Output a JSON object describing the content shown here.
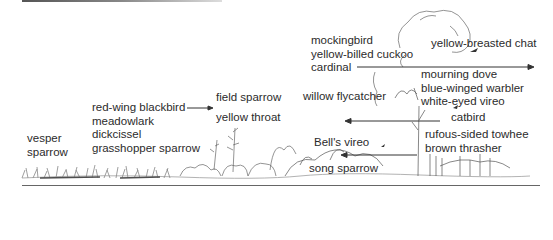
{
  "diagram": {
    "type": "habitat succession bird distribution",
    "groups": [
      {
        "id": "vesper",
        "lines": [
          "vesper",
          "sparrow"
        ]
      },
      {
        "id": "grassland",
        "lines": [
          "red-wing blackbird",
          "meadowlark",
          "dickcissel",
          "grasshopper sparrow"
        ]
      },
      {
        "id": "field-sparrow",
        "lines": [
          "field sparrow"
        ]
      },
      {
        "id": "yellow-throat",
        "lines": [
          "yellow throat"
        ]
      },
      {
        "id": "willow-flycatcher",
        "lines": [
          "willow flycatcher"
        ]
      },
      {
        "id": "shrub-upper",
        "lines": [
          "mockingbird",
          "yellow-billed cuckoo",
          "cardinal"
        ]
      },
      {
        "id": "yellow-breasted-chat",
        "lines": [
          "yellow-breasted chat"
        ]
      },
      {
        "id": "thicket",
        "lines": [
          "mourning dove",
          "blue-winged warbler",
          "white-eyed vireo"
        ]
      },
      {
        "id": "catbird",
        "lines": [
          "catbird"
        ]
      },
      {
        "id": "towhee-thrasher",
        "lines": [
          "rufous-sided towhee",
          "brown thrasher"
        ]
      },
      {
        "id": "bells-vireo",
        "lines": [
          "Bell's vireo"
        ]
      },
      {
        "id": "song-sparrow",
        "lines": [
          "song sparrow"
        ]
      }
    ],
    "arrows": [
      {
        "from": "red-wing blackbird",
        "direction": "right"
      },
      {
        "from": "cardinal",
        "direction": "right"
      },
      {
        "from": "catbird",
        "direction": "left"
      },
      {
        "from": "brown thrasher",
        "direction": "left"
      }
    ],
    "colors": {
      "ink": "#2b2b2b",
      "background": "#ffffff",
      "rule": "#666666"
    }
  }
}
